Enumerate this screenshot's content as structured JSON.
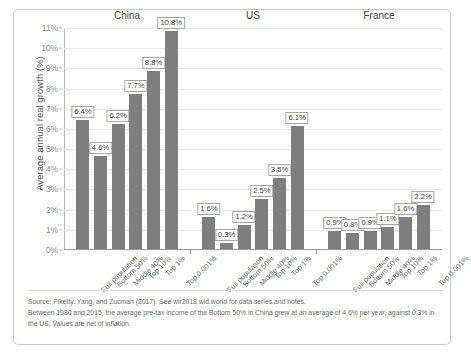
{
  "chart_data": {
    "type": "bar",
    "title": "",
    "xlabel": "",
    "ylabel": "Average annual real growth (%)",
    "ylim": [
      0,
      11
    ],
    "ytick_labels": [
      "0%",
      "1%",
      "2%",
      "3%",
      "4%",
      "5%",
      "6%",
      "7%",
      "8%",
      "9%",
      "10%",
      "11%"
    ],
    "ytick_values": [
      0,
      1,
      2,
      3,
      4,
      5,
      6,
      7,
      8,
      9,
      10,
      11
    ],
    "grid": true,
    "legend": "none",
    "categories": [
      "Full population",
      "Bottom 50%",
      "Middle 40%",
      "Top 10%",
      "Top 1%",
      "Top 0.001%"
    ],
    "groups": [
      {
        "name": "China",
        "values": [
          6.4,
          4.6,
          6.2,
          7.7,
          8.8,
          10.8
        ],
        "value_labels": [
          "6.4%",
          "4.6%",
          "6.2%",
          "7.7%",
          "8.8%",
          "10.8%"
        ]
      },
      {
        "name": "US",
        "values": [
          1.6,
          0.3,
          1.2,
          2.5,
          3.5,
          6.1
        ],
        "value_labels": [
          "1.6%",
          "0.3%",
          "1.2%",
          "2.5%",
          "3.5%",
          "6.1%"
        ]
      },
      {
        "name": "France",
        "values": [
          0.9,
          0.8,
          0.9,
          1.1,
          1.6,
          2.2
        ],
        "value_labels": [
          "0.9%",
          "0.8%",
          "0.9%",
          "1.1%",
          "1.6%",
          "2.2%"
        ]
      }
    ],
    "bar_color": "#7e7e7e"
  },
  "footnotes": {
    "source": "Source: Piketty, Yang, and Zucman (2017). See wir2018.wid.world for data series and notes.",
    "note": "Between 1980 and 2015, the average pre-tax income of the Bottom 50% in China grew at an average of 4.6% per year, against 0.3% in the US. Values are net of inflation."
  }
}
